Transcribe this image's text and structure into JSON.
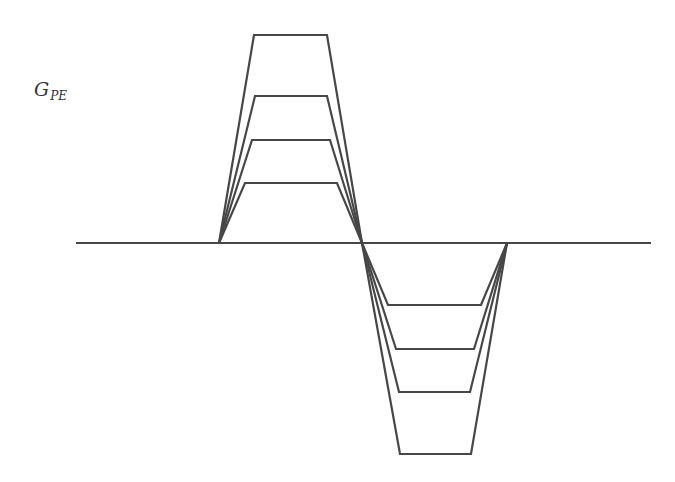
{
  "diagram": {
    "label": {
      "main": "G",
      "subscript": "PE"
    },
    "style": {
      "stroke_color": "#474747",
      "stroke_width": 2.2,
      "background": "#ffffff"
    },
    "baseline": {
      "x1": 76,
      "x2": 651,
      "y": 243
    },
    "waveforms": [
      {
        "name": "gradient-step-1",
        "points": [
          [
            219,
            243
          ],
          [
            254,
            35
          ],
          [
            327,
            35
          ],
          [
            362,
            243
          ],
          [
            400,
            454
          ],
          [
            471,
            454
          ],
          [
            507,
            243
          ]
        ]
      },
      {
        "name": "gradient-step-2",
        "points": [
          [
            219,
            243
          ],
          [
            255,
            96
          ],
          [
            327,
            96
          ],
          [
            362,
            243
          ],
          [
            399,
            392
          ],
          [
            470,
            392
          ],
          [
            507,
            243
          ]
        ]
      },
      {
        "name": "gradient-step-3",
        "points": [
          [
            219,
            243
          ],
          [
            252,
            140
          ],
          [
            330,
            140
          ],
          [
            362,
            243
          ],
          [
            396,
            349
          ],
          [
            474,
            349
          ],
          [
            507,
            243
          ]
        ]
      },
      {
        "name": "gradient-step-4",
        "points": [
          [
            219,
            243
          ],
          [
            245,
            183
          ],
          [
            337,
            183
          ],
          [
            362,
            243
          ],
          [
            388,
            305
          ],
          [
            481,
            305
          ],
          [
            507,
            243
          ]
        ]
      }
    ]
  }
}
